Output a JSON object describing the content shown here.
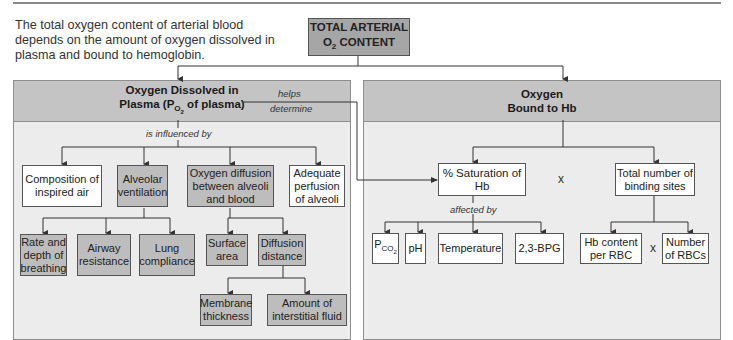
{
  "intro_text": "The total oxygen content of arterial blood depends on the amount of oxygen dissolved in plasma and bound to hemoglobin.",
  "root": {
    "line1": "TOTAL ARTERIAL",
    "o": "O",
    "sub": "2",
    "rest": " CONTENT"
  },
  "left_panel": {
    "title_line1": "Oxygen Dissolved in",
    "title_pre": "Plasma (P",
    "title_sub": "O",
    "title_subsub": "2",
    "title_post": " of plasma)",
    "connector_label": "is influenced by",
    "factors": [
      {
        "label": "Composition of inspired air",
        "shade": "white"
      },
      {
        "label": "Alveolar ventilation",
        "shade": "gray"
      },
      {
        "label": "Oxygen diffusion between alveoli and blood",
        "shade": "gray"
      },
      {
        "label": "Adequate perfusion of alveoli",
        "shade": "white"
      }
    ],
    "ventilation_factors": [
      "Rate and depth of breathing",
      "Airway resistance",
      "Lung compliance"
    ],
    "diffusion_factors": [
      "Surface area",
      "Diffusion distance"
    ],
    "distance_factors": [
      "Membrane thickness",
      "Amount of interstitial fluid"
    ]
  },
  "link_label": {
    "line1": "helps",
    "line2": "determine"
  },
  "right_panel": {
    "title_line1": "Oxygen",
    "title_line2": "Bound to Hb",
    "saturation": "% Saturation of Hb",
    "multiply": "x",
    "binding_sites": "Total number of binding sites",
    "connector_label": "affected by",
    "saturation_factors": [
      {
        "pre": "P",
        "sub": "CO",
        "subsub": "2"
      },
      {
        "label": "pH"
      },
      {
        "label": "Temperature"
      },
      {
        "label": "2,3-BPG"
      }
    ],
    "binding_factors": [
      "Hb content per RBC",
      "Number of RBCs"
    ]
  },
  "colors": {
    "panel_bg": "#ececec",
    "panel_header": "#c4c4c4",
    "gray_box": "#bdbdbd",
    "root_box": "#a6a6a6",
    "line": "#333333"
  }
}
